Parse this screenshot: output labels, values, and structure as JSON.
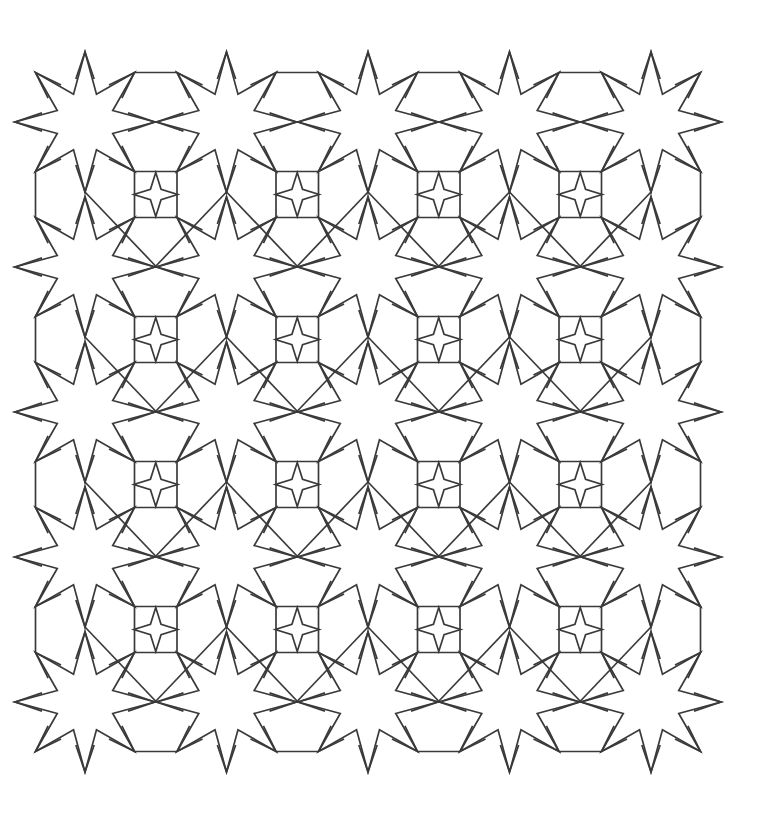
{
  "artwork": {
    "title": "Islamic Geometric Star Pattern",
    "type": "line-drawing",
    "style": "islamic-geometric-tessellation",
    "description": "Monochrome line-art tessellation of interlocking eight-pointed stars on a white ground"
  },
  "canvas": {
    "width": 757,
    "height": 833,
    "background_color": "#ffffff"
  },
  "stroke": {
    "color": "#3a3a3a",
    "width": 1.7,
    "linejoin": "miter",
    "linecap": "butt",
    "fill": "none"
  },
  "lattice": {
    "rows": 5,
    "columns": 5,
    "origin_x": 85,
    "origin_y": 122,
    "spacing_x": 141.5,
    "spacing_y": 145.0,
    "total_stars": 25
  },
  "star_motif": {
    "name": "eight-pointed-star",
    "points": 8,
    "outer_radius": 70,
    "inner_radius": 30,
    "start_angle_deg": -90,
    "point_angle_step_deg": 45
  },
  "rosette_arm": {
    "name": "extended-point-arm",
    "outer_radius": 70,
    "waist_radius": 44,
    "waist_half_width_deg": 12,
    "tip_half_width_deg": 0
  },
  "interstitial_motif": {
    "name": "four-pointed-concave-star",
    "points": 4,
    "outer_radius": 22,
    "inner_radius": 7.5,
    "start_angle_deg": 0,
    "count_rows": 4,
    "count_columns": 4
  },
  "connector_motif": {
    "name": "hexagonal-lattice-bridge",
    "description": "Straight chords joining adjacent star point tips, forming elongated hexagons and kite cells between stars"
  },
  "palette": {
    "line": "#3a3a3a",
    "background": "#ffffff"
  }
}
